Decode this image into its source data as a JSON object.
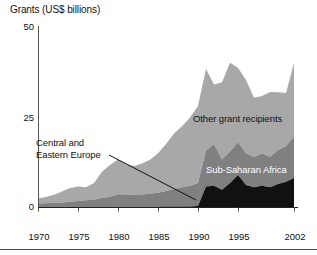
{
  "chart_data": {
    "type": "area",
    "stacked": true,
    "title": "Grants (US$ billions)",
    "xlabel": "",
    "ylabel": "Grants (US$ billions)",
    "xlim": [
      1970,
      2002
    ],
    "ylim": [
      0,
      50
    ],
    "yticks": [
      0,
      25,
      50
    ],
    "ytick_labels": [
      "0",
      "25",
      "50"
    ],
    "xticks": [
      1970,
      1975,
      1980,
      1985,
      1990,
      1995,
      2002
    ],
    "xtick_labels": [
      "1970",
      "1975",
      "1980",
      "1985",
      "1990",
      "1995",
      "2002"
    ],
    "grid": false,
    "legend_position": "inline-annotations",
    "x": [
      1970,
      1971,
      1972,
      1973,
      1974,
      1975,
      1976,
      1977,
      1978,
      1979,
      1980,
      1981,
      1982,
      1983,
      1984,
      1985,
      1986,
      1987,
      1988,
      1989,
      1990,
      1991,
      1992,
      1993,
      1994,
      1995,
      1996,
      1997,
      1998,
      1999,
      2000,
      2001,
      2002
    ],
    "series": [
      {
        "name": "Sub-Saharan Africa",
        "color": "#111111",
        "values": [
          0.0,
          0.0,
          0.0,
          0.0,
          0.0,
          0.0,
          0.0,
          0.0,
          0.0,
          0.0,
          0.2,
          0.2,
          0.2,
          0.2,
          0.2,
          0.2,
          0.3,
          0.3,
          0.3,
          0.3,
          0.4,
          5.8,
          6.0,
          4.9,
          6.8,
          9.0,
          6.2,
          5.6,
          6.0,
          5.6,
          6.5,
          7.1,
          8.2
        ]
      },
      {
        "name": "Central and Eastern Europe",
        "color": "#808080",
        "values": [
          1.1,
          1.2,
          1.3,
          1.4,
          1.6,
          1.8,
          2.0,
          2.2,
          2.6,
          3.0,
          3.5,
          3.4,
          3.3,
          3.4,
          3.6,
          3.9,
          4.3,
          4.8,
          5.3,
          5.7,
          6.4,
          10.0,
          11.6,
          8.4,
          8.7,
          9.1,
          8.8,
          8.4,
          9.0,
          8.4,
          9.4,
          9.9,
          11.5
        ]
      },
      {
        "name": "Other grant recipients",
        "color": "#a8a8a8",
        "values": [
          1.4,
          1.7,
          2.2,
          3.0,
          3.8,
          4.0,
          3.6,
          4.6,
          7.3,
          8.8,
          9.7,
          8.3,
          8.0,
          8.6,
          9.4,
          10.9,
          13.0,
          15.4,
          16.9,
          18.9,
          21.3,
          22.6,
          16.5,
          21.4,
          24.6,
          20.6,
          20.3,
          16.4,
          15.9,
          18.0,
          16.0,
          14.7,
          20.3
        ]
      }
    ],
    "totals": [
      2.5,
      2.9,
      3.5,
      4.4,
      5.4,
      5.8,
      5.6,
      6.8,
      9.9,
      11.8,
      13.4,
      11.9,
      11.5,
      12.2,
      13.2,
      15.0,
      17.6,
      20.5,
      22.5,
      24.9,
      28.1,
      38.4,
      34.1,
      34.7,
      40.1,
      38.7,
      35.3,
      30.4,
      30.9,
      32.0,
      31.9,
      31.7,
      40.0
    ],
    "annotations": [
      {
        "text": "Other grant recipients",
        "x": 1993,
        "y": 27
      },
      {
        "text": "Sub-Saharan Africa",
        "x": 1995,
        "y": 14
      },
      {
        "text": "Central and\nEastern Europe",
        "x": 1975,
        "y": 19
      }
    ]
  },
  "labels": {
    "title": "Grants (US$ billions)",
    "other_grant_recipients": "Other grant recipients",
    "sub_saharan_africa": "Sub-Saharan Africa",
    "central_eastern_europe_line1": "Central and",
    "central_eastern_europe_line2": "Eastern Europe",
    "y0": "0",
    "y25": "25",
    "y50": "50",
    "x1970": "1970",
    "x1975": "1975",
    "x1980": "1980",
    "x1985": "1985",
    "x1990": "1990",
    "x1995": "1995",
    "x2002": "2002"
  },
  "colors": {
    "other_grant_recipients": "#a8a8a8",
    "central_eastern_europe": "#808080",
    "sub_saharan_africa": "#111111",
    "axis": "#555555",
    "text": "#111111"
  }
}
